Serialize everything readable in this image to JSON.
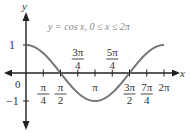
{
  "chart_data": {
    "type": "line",
    "title": "y = cos x, 0 ≤ x ≤ 2π",
    "xlabel": "x",
    "ylabel": "y",
    "xlim": [
      0,
      6.2832
    ],
    "ylim": [
      -1,
      1
    ],
    "x_tick_labels": [
      {
        "num": "π",
        "den": "4",
        "value": 0.7854,
        "pos": "below"
      },
      {
        "num": "π",
        "den": "2",
        "value": 1.5708,
        "pos": "below"
      },
      {
        "num": "3π",
        "den": "4",
        "value": 2.3562,
        "pos": "above"
      },
      {
        "num": "π",
        "den": "",
        "value": 3.1416,
        "pos": "below"
      },
      {
        "num": "5π",
        "den": "4",
        "value": 3.927,
        "pos": "above"
      },
      {
        "num": "3π",
        "den": "2",
        "value": 4.7124,
        "pos": "below"
      },
      {
        "num": "7π",
        "den": "4",
        "value": 5.4978,
        "pos": "below"
      },
      {
        "num": "2π",
        "den": "",
        "value": 6.2832,
        "pos": "below"
      }
    ],
    "y_tick_labels": [
      "1",
      "0",
      "−1"
    ],
    "series": [
      {
        "name": "cos x",
        "x": [
          0,
          0.7854,
          1.5708,
          2.3562,
          3.1416,
          3.927,
          4.7124,
          5.4978,
          6.2832
        ],
        "y": [
          1,
          0.707,
          0,
          -0.707,
          -1,
          -0.707,
          0,
          0.707,
          1
        ]
      }
    ],
    "grid": false,
    "colors": {
      "curve": "#777777",
      "axes": "#222222"
    }
  }
}
